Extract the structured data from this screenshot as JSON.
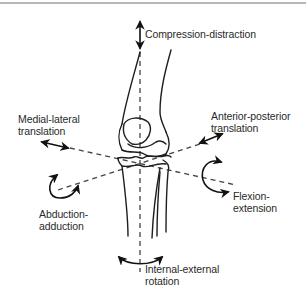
{
  "figure": {
    "colors": {
      "line": "#1e1e1e",
      "axis": "#444444",
      "text": "#2a2a2a",
      "top_rule": "#b8b8b8",
      "background": "#ffffff"
    },
    "labels": {
      "compression_distraction": {
        "lines": [
          "Compression-distraction"
        ]
      },
      "medial_lateral": {
        "lines": [
          "Medial-lateral",
          "translation"
        ]
      },
      "anterior_posterior": {
        "lines": [
          "Anterior-posterior",
          "translation"
        ]
      },
      "abduction_adduction": {
        "lines": [
          "Abduction-",
          "adduction"
        ]
      },
      "flexion_extension": {
        "lines": [
          "Flexion-",
          "extension"
        ]
      },
      "internal_external": {
        "lines": [
          "Internal-external",
          "rotation"
        ]
      }
    },
    "motions": [
      {
        "name": "Compression-distraction",
        "type": "translation",
        "axis": "vertical (superior-inferior)"
      },
      {
        "name": "Medial-lateral translation",
        "type": "translation",
        "axis": "medial-lateral"
      },
      {
        "name": "Anterior-posterior translation",
        "type": "translation",
        "axis": "anterior-posterior"
      },
      {
        "name": "Abduction-adduction",
        "type": "rotation",
        "axis": "anterior-posterior"
      },
      {
        "name": "Flexion-extension",
        "type": "rotation",
        "axis": "medial-lateral"
      },
      {
        "name": "Internal-external rotation",
        "type": "rotation",
        "axis": "vertical (superior-inferior)"
      }
    ]
  }
}
